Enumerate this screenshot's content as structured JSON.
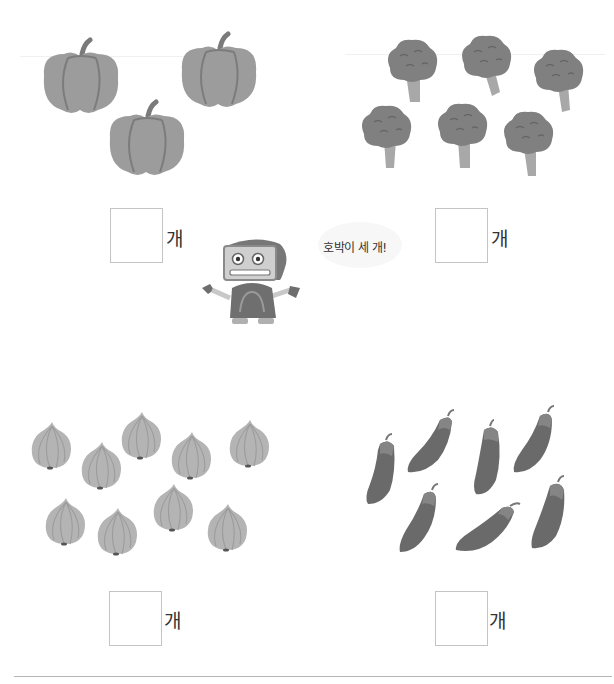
{
  "worksheet": {
    "panels": [
      {
        "item": "pumpkin",
        "count": 3,
        "answer_value": "",
        "unit_label": "개"
      },
      {
        "item": "broccoli",
        "count": 6,
        "answer_value": "",
        "unit_label": "개"
      },
      {
        "item": "onion",
        "count": 9,
        "answer_value": "",
        "unit_label": "개"
      },
      {
        "item": "eggplant",
        "count": 7,
        "answer_value": "",
        "unit_label": "개"
      }
    ],
    "helper": {
      "character": "robot",
      "speech_bubble": "호박이 세 개!"
    }
  },
  "colors": {
    "pumpkin": "#9a9a9a",
    "broccoli": "#7e7e7e",
    "onion": "#b4b4b4",
    "eggplant": "#6a6a6a",
    "box_border": "#c4c4c4"
  }
}
